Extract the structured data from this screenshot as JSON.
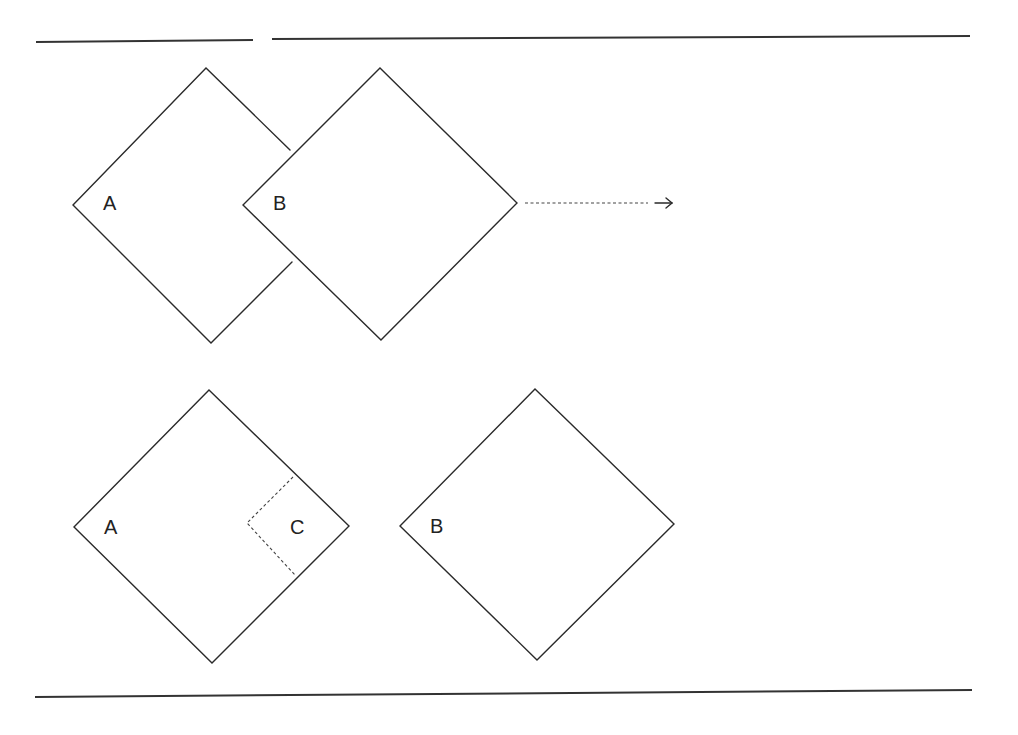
{
  "diagram": {
    "top_row": {
      "square_a": {
        "label": "A"
      },
      "square_b": {
        "label": "B"
      },
      "arrow": {
        "style": "dotted",
        "direction": "right"
      }
    },
    "bottom_row": {
      "square_a": {
        "label": "A"
      },
      "region_c": {
        "label": "C",
        "style": "dotted"
      },
      "square_b": {
        "label": "B"
      }
    },
    "colors": {
      "stroke": "#2a2a2a",
      "background": "#ffffff"
    }
  }
}
